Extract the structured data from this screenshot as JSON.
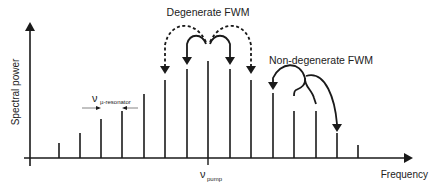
{
  "diagram": {
    "axes": {
      "y_label": "Spectral power",
      "x_label": "Frequency"
    },
    "annotations": {
      "degenerate": "Degenerate FWM",
      "non_degenerate": "Non-degenerate FWM",
      "resonator_symbol": "ν",
      "resonator_sub": "µ-resonator",
      "pump_symbol": "ν",
      "pump_sub": "pump"
    },
    "comb_lines": [
      {
        "x": 59,
        "top": 143
      },
      {
        "x": 80,
        "top": 133
      },
      {
        "x": 101,
        "top": 119
      },
      {
        "x": 122,
        "top": 111
      },
      {
        "x": 144,
        "top": 94
      },
      {
        "x": 165,
        "top": 80
      },
      {
        "x": 187,
        "top": 69
      },
      {
        "x": 208,
        "top": 61
      },
      {
        "x": 230,
        "top": 69
      },
      {
        "x": 251,
        "top": 80
      },
      {
        "x": 273,
        "top": 93
      },
      {
        "x": 294,
        "top": 111
      },
      {
        "x": 316,
        "top": 111
      },
      {
        "x": 337,
        "top": 133
      },
      {
        "x": 358,
        "top": 145
      }
    ],
    "colors": {
      "ink": "#1a1a1a",
      "text": "#222222"
    }
  }
}
